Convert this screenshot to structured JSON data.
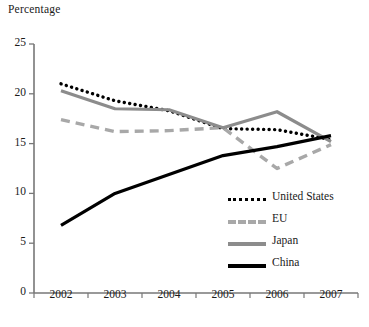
{
  "chart_data": {
    "type": "line",
    "title": "",
    "ylabel": "Percentage",
    "xlabel": "",
    "categories": [
      "2002",
      "2003",
      "2004",
      "2005",
      "2006",
      "2007"
    ],
    "ylim": [
      0,
      25
    ],
    "yticks": [
      0,
      5,
      10,
      15,
      20,
      25
    ],
    "grid": false,
    "legend_position": "inside-right",
    "series": [
      {
        "name": "United States",
        "style": "dotted",
        "color": "#000000",
        "values": [
          21.0,
          19.3,
          18.3,
          16.5,
          16.4,
          15.4
        ]
      },
      {
        "name": "EU",
        "style": "dashed",
        "color": "#a8a8a8",
        "values": [
          17.4,
          16.2,
          16.3,
          16.6,
          12.5,
          14.9
        ]
      },
      {
        "name": "Japan",
        "style": "solid",
        "color": "#8c8c8c",
        "values": [
          20.3,
          18.5,
          18.4,
          16.6,
          18.2,
          15.2
        ]
      },
      {
        "name": "China",
        "style": "solid",
        "color": "#000000",
        "values": [
          6.8,
          10.0,
          11.9,
          13.8,
          14.7,
          15.8
        ]
      }
    ]
  },
  "axis": {
    "y_title": "Percentage",
    "y_tick_labels": [
      "25",
      "20",
      "15",
      "10",
      "5",
      "0"
    ],
    "x_tick_labels": [
      "2002",
      "2003",
      "2004",
      "2005",
      "2006",
      "2007"
    ]
  },
  "legend": {
    "items": [
      {
        "label": "United States",
        "swatch": "dotted-line-black"
      },
      {
        "label": "EU",
        "swatch": "dashed-line-gray"
      },
      {
        "label": "Japan",
        "swatch": "solid-line-gray"
      },
      {
        "label": "China",
        "swatch": "solid-line-black"
      }
    ]
  },
  "colors": {
    "united_states": "#000000",
    "eu": "#a8a8a8",
    "japan": "#8c8c8c",
    "china": "#000000",
    "axis": "#777777",
    "background": "#ffffff"
  }
}
